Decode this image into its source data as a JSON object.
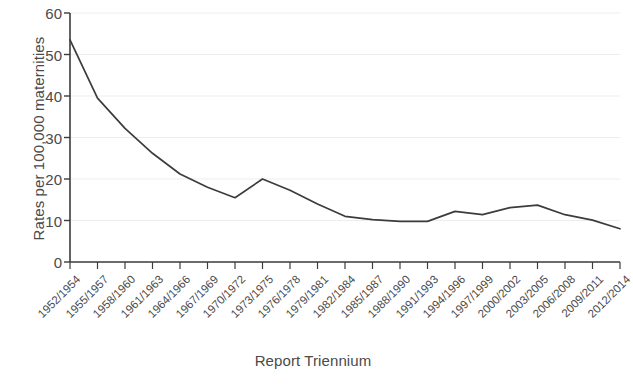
{
  "chart_data": {
    "type": "line",
    "title": "",
    "xlabel": "Report Triennium",
    "ylabel": "Rates per 100,000 maternities",
    "categories": [
      "1952/1954",
      "1955/1957",
      "1958/1960",
      "1961/1963",
      "1964/1966",
      "1967/1969",
      "1970/1972",
      "1973/1975",
      "1976/1978",
      "1979/1981",
      "1982/1984",
      "1985/1987",
      "1988/1990",
      "1991/1993",
      "1994/1996",
      "1997/1999",
      "2000/2002",
      "2003/2005",
      "2006/2008",
      "2009/2011",
      "2012/2014"
    ],
    "values": [
      53.5,
      39.5,
      32.2,
      26.2,
      21.2,
      18.0,
      15.5,
      20.0,
      17.3,
      14.0,
      11.0,
      10.2,
      9.8,
      9.8,
      12.2,
      11.4,
      13.1,
      13.7,
      11.4,
      10.1,
      8.0
    ],
    "ylim": [
      0,
      60
    ],
    "yticks": [
      0,
      10,
      20,
      30,
      40,
      50,
      60
    ],
    "ytick_labels": [
      "0",
      "10",
      "20",
      "30",
      "40",
      "50",
      "60"
    ],
    "grid": true,
    "legend": "none",
    "series_color": "#3c3c3c",
    "grid_color": "#ededed",
    "axis_color": "#3c3c3c"
  }
}
